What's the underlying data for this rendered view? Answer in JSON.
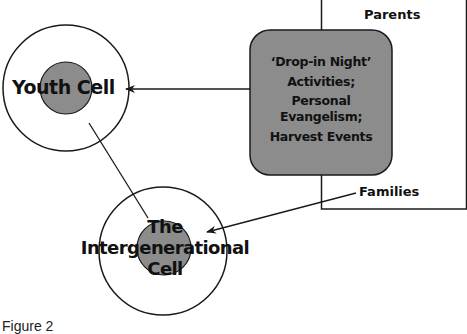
{
  "diagram": {
    "nodes": {
      "youth_cell": {
        "label": "Youth Cell"
      },
      "intergenerational_cell": {
        "label_lines": [
          "The",
          "Intergenerational",
          "Cell"
        ]
      },
      "activities_box": {
        "label_lines": [
          "‘Drop-in Night’",
          "Activities;",
          "Personal",
          "Evangelism;",
          "Harvest Events"
        ]
      },
      "parents_box": {
        "label": "Parents"
      },
      "families_label": {
        "label": "Families"
      }
    },
    "edges": [
      {
        "from": "activities_box",
        "to": "youth_cell",
        "type": "arrow"
      },
      {
        "from": "families_label",
        "to": "intergenerational_cell",
        "type": "arrow"
      },
      {
        "from": "youth_cell",
        "to": "intergenerational_cell",
        "type": "line"
      }
    ],
    "colors": {
      "fill_gray": "#8c8c8c",
      "stroke": "#1a1a1a",
      "background": "#ffffff"
    }
  },
  "caption": "Figure 2"
}
